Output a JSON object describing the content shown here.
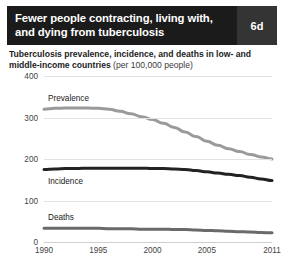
{
  "header": {
    "title_line1": "Fewer people contracting, living with,",
    "title_line2": "and dying from tuberculosis",
    "badge": "6d",
    "bar_color": "#1b1b1b",
    "badge_color": "#343434"
  },
  "subtitle": {
    "main": "Tuberculosis prevalence, incidence, and deaths in low- and middle-income countries ",
    "unit": "(per 100,000 people)"
  },
  "chart_data": {
    "type": "line",
    "title": "Tuberculosis prevalence, incidence, and deaths in low- and middle-income countries (per 100,000 people)",
    "xlabel": "",
    "ylabel": "per 100,000 people",
    "xlim": [
      1990,
      2011
    ],
    "ylim": [
      0,
      400
    ],
    "grid": true,
    "legend_position": "inline-labels",
    "yticks": [
      0,
      100,
      200,
      300,
      400
    ],
    "xticks": [
      1990,
      1995,
      2000,
      2005,
      2011
    ],
    "x": [
      1990,
      1991,
      1992,
      1993,
      1994,
      1995,
      1996,
      1997,
      1998,
      1999,
      2000,
      2001,
      2002,
      2003,
      2004,
      2005,
      2006,
      2007,
      2008,
      2009,
      2010,
      2011
    ],
    "series": [
      {
        "name": "Prevalence",
        "color": "#9a9a9a",
        "width": 3,
        "values": [
          320,
          322,
          323,
          323,
          323,
          322,
          320,
          315,
          309,
          302,
          295,
          286,
          276,
          265,
          254,
          243,
          233,
          225,
          218,
          211,
          205,
          200
        ]
      },
      {
        "name": "Incidence",
        "color": "#222222",
        "width": 3,
        "values": [
          175,
          176,
          177,
          177,
          178,
          178,
          178,
          178,
          178,
          178,
          177,
          177,
          176,
          175,
          172,
          169,
          166,
          163,
          160,
          156,
          152,
          148
        ]
      },
      {
        "name": "Deaths",
        "color": "#6a6a6a",
        "width": 3,
        "values": [
          33,
          33,
          33,
          33,
          33,
          33,
          32,
          32,
          32,
          31,
          31,
          31,
          30,
          30,
          29,
          28,
          27,
          26,
          25,
          24,
          23,
          22
        ]
      }
    ]
  }
}
